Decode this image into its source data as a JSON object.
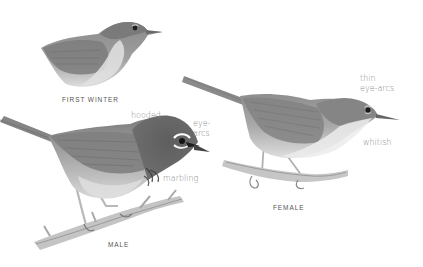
{
  "plate": {
    "background": "#ffffff",
    "figures": [
      {
        "id": "first-winter",
        "caption": "FIRST WINTER",
        "annotations": []
      },
      {
        "id": "male",
        "caption": "MALE",
        "annotations": [
          {
            "text": "hooded"
          },
          {
            "line1": "eye-",
            "line2": "arcs"
          },
          {
            "text": "marbling"
          }
        ]
      },
      {
        "id": "female",
        "caption": "FEMALE",
        "annotations": [
          {
            "line1": "thin",
            "line2": "eye-arcs"
          },
          {
            "text": "whitish"
          }
        ]
      }
    ]
  },
  "colors": {
    "caption_text": "#555555",
    "annotation_text": "#8a8a8a",
    "upperparts": "#8c8c8c",
    "underparts": "#d4d4d4",
    "hood": "#5a5a5a",
    "eye_arc": "#ffffff",
    "branch": "#b5b5b5"
  }
}
